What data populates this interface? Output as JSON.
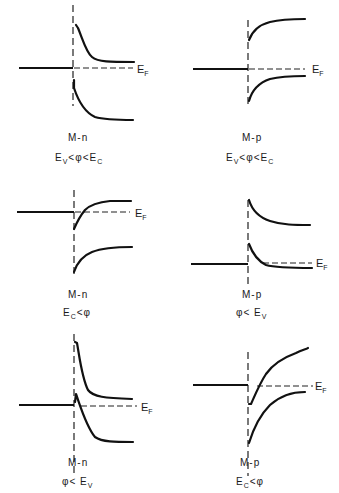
{
  "figure": {
    "fermi_label": {
      "main": "E",
      "sub": "F"
    },
    "panels": [
      {
        "id": "p1",
        "junction": "M-n",
        "condition": {
          "parts": [
            [
              "E",
              "V"
            ],
            [
              "<φ<",
              ""
            ],
            [
              "E",
              "C"
            ]
          ]
        },
        "condition_text": "Ev < φ < Ec"
      },
      {
        "id": "p2",
        "junction": "M-p",
        "condition": {
          "parts": [
            [
              "E",
              "V"
            ],
            [
              "<φ<",
              ""
            ],
            [
              "E",
              "C"
            ]
          ]
        },
        "condition_text": "Ev < φ < Ec"
      },
      {
        "id": "p3",
        "junction": "M-n",
        "condition": {
          "parts": [
            [
              "E",
              "C"
            ],
            [
              "<φ",
              ""
            ]
          ]
        },
        "condition_text": "Ec < φ"
      },
      {
        "id": "p4",
        "junction": "M-p",
        "condition": {
          "parts": [
            [
              "φ< ",
              ""
            ],
            [
              "E",
              "V"
            ]
          ]
        },
        "condition_text": "φ < Ev"
      },
      {
        "id": "p5",
        "junction": "M-n",
        "condition": {
          "parts": [
            [
              "φ< ",
              ""
            ],
            [
              "E",
              "V"
            ]
          ]
        },
        "condition_text": "φ < Ev"
      },
      {
        "id": "p6",
        "junction": "M-p",
        "condition": {
          "parts": [
            [
              "E",
              "C"
            ],
            [
              "<φ",
              ""
            ]
          ]
        },
        "condition_text": "Ec < φ"
      }
    ],
    "colors": {
      "line": "#111111",
      "background": "#ffffff"
    }
  }
}
